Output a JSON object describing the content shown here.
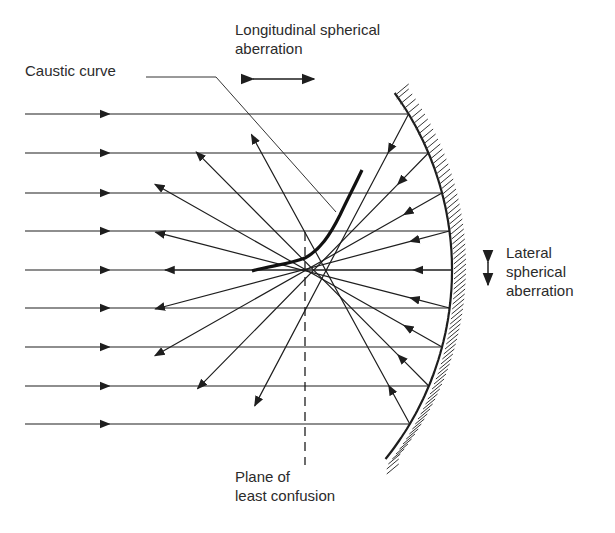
{
  "figure": {
    "type": "optics-diagram",
    "labels": {
      "longitudinal": "Longitudinal spherical\naberration",
      "caustic": "Caustic curve",
      "lateral": "Lateral\nspherical\naberration",
      "plane": "Plane of\nleast confusion"
    },
    "incident_ray_y": [
      114,
      153,
      193,
      231,
      270,
      308,
      347,
      386,
      424
    ],
    "colors": {
      "ink": "#1e1e1e",
      "text": "#2b2b2b",
      "background": "#ffffff"
    }
  }
}
